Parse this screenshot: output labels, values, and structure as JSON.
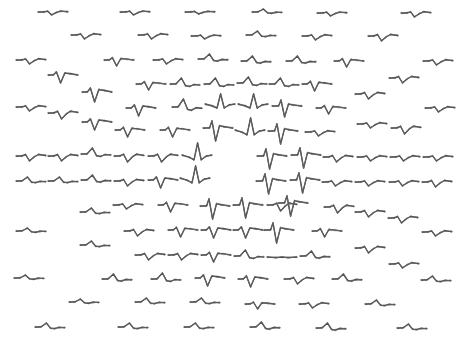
{
  "figure": {
    "width": 466,
    "height": 353,
    "trace_color": "#3a3a3a",
    "trace_width": 30
  },
  "waveforms": [
    {
      "x": 38,
      "y": 12,
      "type": "dip",
      "amp": 3
    },
    {
      "x": 120,
      "y": 12,
      "type": "dip",
      "amp": 3
    },
    {
      "x": 185,
      "y": 12,
      "type": "dip",
      "amp": 2
    },
    {
      "x": 252,
      "y": 12,
      "type": "bump",
      "amp": 3
    },
    {
      "x": 317,
      "y": 13,
      "type": "dip",
      "amp": 3
    },
    {
      "x": 401,
      "y": 13,
      "type": "dip",
      "amp": 4
    },
    {
      "x": 71,
      "y": 35,
      "type": "dip",
      "amp": 4
    },
    {
      "x": 138,
      "y": 35,
      "type": "dip",
      "amp": 4
    },
    {
      "x": 191,
      "y": 36,
      "type": "dip",
      "amp": 3
    },
    {
      "x": 246,
      "y": 35,
      "type": "bump",
      "amp": 4
    },
    {
      "x": 302,
      "y": 36,
      "type": "dip",
      "amp": 4
    },
    {
      "x": 368,
      "y": 36,
      "type": "dip",
      "amp": 5
    },
    {
      "x": 16,
      "y": 60,
      "type": "dip",
      "amp": 4
    },
    {
      "x": 104,
      "y": 60,
      "type": "spike",
      "amp": 6
    },
    {
      "x": 153,
      "y": 60,
      "type": "dip",
      "amp": 4
    },
    {
      "x": 198,
      "y": 59,
      "type": "bump",
      "amp": 5
    },
    {
      "x": 241,
      "y": 61,
      "type": "bump",
      "amp": 5
    },
    {
      "x": 286,
      "y": 61,
      "type": "bump",
      "amp": 5
    },
    {
      "x": 334,
      "y": 61,
      "type": "spike",
      "amp": 6
    },
    {
      "x": 423,
      "y": 61,
      "type": "dip",
      "amp": 4
    },
    {
      "x": 48,
      "y": 75,
      "type": "spike",
      "amp": 8
    },
    {
      "x": 389,
      "y": 78,
      "type": "dip",
      "amp": 5
    },
    {
      "x": 82,
      "y": 92,
      "type": "spike",
      "amp": 10
    },
    {
      "x": 136,
      "y": 84,
      "type": "spike",
      "amp": 6
    },
    {
      "x": 170,
      "y": 84,
      "type": "bump",
      "amp": 6
    },
    {
      "x": 204,
      "y": 84,
      "type": "bump",
      "amp": 6
    },
    {
      "x": 237,
      "y": 83,
      "type": "bump",
      "amp": 6
    },
    {
      "x": 269,
      "y": 84,
      "type": "bump",
      "amp": 6
    },
    {
      "x": 302,
      "y": 84,
      "type": "spike",
      "amp": 7
    },
    {
      "x": 355,
      "y": 94,
      "type": "dip",
      "amp": 5
    },
    {
      "x": 16,
      "y": 107,
      "type": "dip",
      "amp": 4
    },
    {
      "x": 48,
      "y": 113,
      "type": "dip",
      "amp": 6
    },
    {
      "x": 82,
      "y": 122,
      "type": "spike",
      "amp": 8
    },
    {
      "x": 126,
      "y": 108,
      "type": "spike",
      "amp": 8
    },
    {
      "x": 172,
      "y": 107,
      "type": "bump",
      "amp": 8
    },
    {
      "x": 205,
      "y": 104,
      "type": "bigbump",
      "amp": 10
    },
    {
      "x": 238,
      "y": 104,
      "type": "bigbump",
      "amp": 10
    },
    {
      "x": 272,
      "y": 106,
      "type": "bigspike",
      "amp": 10
    },
    {
      "x": 316,
      "y": 108,
      "type": "spike",
      "amp": 6
    },
    {
      "x": 425,
      "y": 108,
      "type": "dip",
      "amp": 4
    },
    {
      "x": 115,
      "y": 130,
      "type": "spike",
      "amp": 7
    },
    {
      "x": 160,
      "y": 130,
      "type": "spike",
      "amp": 7
    },
    {
      "x": 203,
      "y": 128,
      "type": "bigspike",
      "amp": 12
    },
    {
      "x": 235,
      "y": 130,
      "type": "bigbump",
      "amp": 12
    },
    {
      "x": 268,
      "y": 131,
      "type": "bigspike",
      "amp": 12
    },
    {
      "x": 305,
      "y": 132,
      "type": "dip",
      "amp": 4
    },
    {
      "x": 357,
      "y": 124,
      "type": "dip",
      "amp": 4
    },
    {
      "x": 391,
      "y": 128,
      "type": "dip",
      "amp": 6
    },
    {
      "x": 16,
      "y": 156,
      "type": "dip",
      "amp": 5
    },
    {
      "x": 48,
      "y": 156,
      "type": "dip",
      "amp": 5
    },
    {
      "x": 81,
      "y": 154,
      "type": "bump",
      "amp": 6
    },
    {
      "x": 114,
      "y": 156,
      "type": "dip",
      "amp": 6
    },
    {
      "x": 148,
      "y": 156,
      "type": "dip",
      "amp": 6
    },
    {
      "x": 182,
      "y": 155,
      "type": "bigbump",
      "amp": 12
    },
    {
      "x": 257,
      "y": 156,
      "type": "bigspike",
      "amp": 12
    },
    {
      "x": 291,
      "y": 155,
      "type": "bigspike",
      "amp": 12
    },
    {
      "x": 323,
      "y": 157,
      "type": "dip",
      "amp": 5
    },
    {
      "x": 357,
      "y": 157,
      "type": "dip",
      "amp": 4
    },
    {
      "x": 390,
      "y": 157,
      "type": "dip",
      "amp": 4
    },
    {
      "x": 423,
      "y": 157,
      "type": "dip",
      "amp": 4
    },
    {
      "x": 16,
      "y": 181,
      "type": "bump",
      "amp": 4
    },
    {
      "x": 48,
      "y": 181,
      "type": "bump",
      "amp": 4
    },
    {
      "x": 81,
      "y": 180,
      "type": "bump",
      "amp": 5
    },
    {
      "x": 114,
      "y": 181,
      "type": "dip",
      "amp": 5
    },
    {
      "x": 148,
      "y": 180,
      "type": "spike",
      "amp": 8
    },
    {
      "x": 180,
      "y": 178,
      "type": "bigbump",
      "amp": 12
    },
    {
      "x": 256,
      "y": 181,
      "type": "bigspike",
      "amp": 12
    },
    {
      "x": 290,
      "y": 180,
      "type": "bigspike",
      "amp": 12
    },
    {
      "x": 322,
      "y": 182,
      "type": "dip",
      "amp": 4
    },
    {
      "x": 355,
      "y": 182,
      "type": "dip",
      "amp": 4
    },
    {
      "x": 389,
      "y": 182,
      "type": "dip",
      "amp": 4
    },
    {
      "x": 422,
      "y": 182,
      "type": "dip",
      "amp": 5
    },
    {
      "x": 80,
      "y": 212,
      "type": "bump",
      "amp": 4
    },
    {
      "x": 113,
      "y": 205,
      "type": "dip",
      "amp": 4
    },
    {
      "x": 158,
      "y": 205,
      "type": "spike",
      "amp": 7
    },
    {
      "x": 200,
      "y": 206,
      "type": "bigspike",
      "amp": 12
    },
    {
      "x": 233,
      "y": 205,
      "type": "bigspike",
      "amp": 12
    },
    {
      "x": 267,
      "y": 205,
      "type": "dip",
      "amp": 6
    },
    {
      "x": 278,
      "y": 203,
      "type": "bigspike",
      "amp": 12
    },
    {
      "x": 324,
      "y": 207,
      "type": "dip",
      "amp": 6
    },
    {
      "x": 355,
      "y": 212,
      "type": "dip",
      "amp": 5
    },
    {
      "x": 388,
      "y": 218,
      "type": "dip",
      "amp": 5
    },
    {
      "x": 16,
      "y": 231,
      "type": "bump",
      "amp": 3
    },
    {
      "x": 124,
      "y": 231,
      "type": "dip",
      "amp": 5
    },
    {
      "x": 168,
      "y": 230,
      "type": "spike",
      "amp": 7
    },
    {
      "x": 201,
      "y": 230,
      "type": "spike",
      "amp": 8
    },
    {
      "x": 233,
      "y": 230,
      "type": "spike",
      "amp": 8
    },
    {
      "x": 264,
      "y": 230,
      "type": "bigspike",
      "amp": 12
    },
    {
      "x": 312,
      "y": 231,
      "type": "spike",
      "amp": 6
    },
    {
      "x": 422,
      "y": 232,
      "type": "dip",
      "amp": 4
    },
    {
      "x": 80,
      "y": 245,
      "type": "bump",
      "amp": 4
    },
    {
      "x": 135,
      "y": 255,
      "type": "dip",
      "amp": 5
    },
    {
      "x": 168,
      "y": 255,
      "type": "dip",
      "amp": 5
    },
    {
      "x": 201,
      "y": 255,
      "type": "spike",
      "amp": 7
    },
    {
      "x": 234,
      "y": 256,
      "type": "bump",
      "amp": 6
    },
    {
      "x": 267,
      "y": 257,
      "type": "flat",
      "amp": 2
    },
    {
      "x": 300,
      "y": 256,
      "type": "bump",
      "amp": 5
    },
    {
      "x": 355,
      "y": 248,
      "type": "dip",
      "amp": 5
    },
    {
      "x": 389,
      "y": 264,
      "type": "dip",
      "amp": 4
    },
    {
      "x": 14,
      "y": 278,
      "type": "bump",
      "amp": 3
    },
    {
      "x": 102,
      "y": 279,
      "type": "bump",
      "amp": 5
    },
    {
      "x": 151,
      "y": 279,
      "type": "bump",
      "amp": 6
    },
    {
      "x": 195,
      "y": 278,
      "type": "spike",
      "amp": 8
    },
    {
      "x": 238,
      "y": 279,
      "type": "spike",
      "amp": 8
    },
    {
      "x": 284,
      "y": 279,
      "type": "dip",
      "amp": 5
    },
    {
      "x": 332,
      "y": 279,
      "type": "bump",
      "amp": 5
    },
    {
      "x": 421,
      "y": 280,
      "type": "bump",
      "amp": 4
    },
    {
      "x": 69,
      "y": 302,
      "type": "bump",
      "amp": 3
    },
    {
      "x": 135,
      "y": 302,
      "type": "bump",
      "amp": 4
    },
    {
      "x": 190,
      "y": 302,
      "type": "bump",
      "amp": 4
    },
    {
      "x": 245,
      "y": 304,
      "type": "spike",
      "amp": 5
    },
    {
      "x": 299,
      "y": 304,
      "type": "dip",
      "amp": 4
    },
    {
      "x": 365,
      "y": 304,
      "type": "bump",
      "amp": 4
    },
    {
      "x": 35,
      "y": 327,
      "type": "bump",
      "amp": 4
    },
    {
      "x": 118,
      "y": 327,
      "type": "bump",
      "amp": 4
    },
    {
      "x": 184,
      "y": 327,
      "type": "bump",
      "amp": 4
    },
    {
      "x": 250,
      "y": 327,
      "type": "bump",
      "amp": 5
    },
    {
      "x": 316,
      "y": 328,
      "type": "bump",
      "amp": 5
    },
    {
      "x": 397,
      "y": 328,
      "type": "bump",
      "amp": 4
    }
  ]
}
